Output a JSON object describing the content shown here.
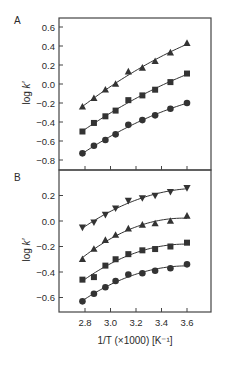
{
  "figure": {
    "xlabel": "1/T (×1000) [K⁻¹]",
    "xticks": [
      "2.8",
      "3.0",
      "3.2",
      "3.4",
      "3.6"
    ]
  },
  "chart_data": [
    {
      "type": "scatter",
      "panel": "A",
      "xlabel": "1/T (×1000) [K⁻¹]",
      "ylabel": "log k′",
      "xlim": [
        2.62,
        3.8
      ],
      "ylim": [
        -0.9,
        0.7
      ],
      "yticks": [
        0.6,
        0.4,
        0.2,
        0.0,
        -0.2,
        -0.4,
        -0.6,
        -0.8
      ],
      "ytick_labels": [
        "0.6",
        "0.4",
        "0.2",
        "0.0",
        "−0.2",
        "−0.4",
        "−0.6",
        "−0.8"
      ],
      "xticks": [
        2.8,
        3.0,
        3.2,
        3.4,
        3.6
      ],
      "grid": false,
      "fit_lines": true,
      "x": [
        2.78,
        2.87,
        2.96,
        3.04,
        3.14,
        3.25,
        3.35,
        3.47,
        3.6
      ],
      "series": [
        {
          "name": "triangle",
          "marker": "triangle-up",
          "values": [
            -0.24,
            -0.15,
            -0.06,
            0.0,
            0.13,
            0.17,
            0.24,
            0.33,
            0.43
          ]
        },
        {
          "name": "square",
          "marker": "square",
          "values": [
            -0.5,
            -0.41,
            -0.34,
            -0.28,
            -0.17,
            -0.12,
            -0.06,
            0.02,
            0.11
          ]
        },
        {
          "name": "circle",
          "marker": "circle",
          "values": [
            -0.73,
            -0.65,
            -0.59,
            -0.53,
            -0.43,
            -0.38,
            -0.33,
            -0.26,
            -0.2
          ]
        }
      ]
    },
    {
      "type": "scatter",
      "panel": "B",
      "xlabel": "1/T (×1000) [K⁻¹]",
      "ylabel": "log k′",
      "xlim": [
        2.62,
        3.8
      ],
      "ylim": [
        -0.75,
        0.38
      ],
      "yticks": [
        0.2,
        0.0,
        -0.2,
        -0.4,
        -0.6
      ],
      "ytick_labels": [
        "0.2",
        "0.0",
        "−0.2",
        "−0.4",
        "−0.6"
      ],
      "xticks": [
        2.8,
        3.0,
        3.2,
        3.4,
        3.6
      ],
      "xtick_labels": [
        "2.8",
        "3.0",
        "3.2",
        "3.4",
        "3.6"
      ],
      "grid": false,
      "fit_lines": true,
      "x": [
        2.78,
        2.87,
        2.96,
        3.04,
        3.14,
        3.25,
        3.35,
        3.47,
        3.6
      ],
      "series": [
        {
          "name": "inverted-triangle",
          "marker": "triangle-down",
          "values": [
            -0.05,
            -0.01,
            0.05,
            0.1,
            0.16,
            0.18,
            0.2,
            0.23,
            0.26
          ]
        },
        {
          "name": "triangle",
          "marker": "triangle-up",
          "values": [
            -0.3,
            -0.22,
            -0.15,
            -0.11,
            -0.06,
            -0.03,
            -0.02,
            0.0,
            0.04
          ]
        },
        {
          "name": "square",
          "marker": "square",
          "values": [
            -0.46,
            -0.44,
            -0.35,
            -0.3,
            -0.26,
            -0.23,
            -0.22,
            -0.2,
            -0.17
          ]
        },
        {
          "name": "circle",
          "marker": "circle",
          "values": [
            -0.63,
            -0.57,
            -0.52,
            -0.47,
            -0.42,
            -0.41,
            -0.39,
            -0.37,
            -0.34
          ]
        }
      ]
    }
  ]
}
